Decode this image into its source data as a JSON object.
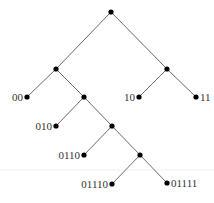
{
  "diagram": {
    "type": "binary-tree",
    "title": "",
    "colors": {
      "edge": "#6a6a6a",
      "node": "#000000",
      "label": "#333333"
    },
    "nodes": [
      {
        "id": "root",
        "x": 111,
        "y": 12,
        "label": ""
      },
      {
        "id": "0",
        "x": 56,
        "y": 69,
        "label": ""
      },
      {
        "id": "1",
        "x": 167,
        "y": 69,
        "label": ""
      },
      {
        "id": "00",
        "x": 27,
        "y": 97,
        "label": "00",
        "label_side": "left"
      },
      {
        "id": "01",
        "x": 84,
        "y": 97,
        "label": ""
      },
      {
        "id": "10",
        "x": 139,
        "y": 97,
        "label": "10",
        "label_side": "left"
      },
      {
        "id": "11",
        "x": 196,
        "y": 97,
        "label": "11",
        "label_side": "right"
      },
      {
        "id": "010",
        "x": 56,
        "y": 126,
        "label": "010",
        "label_side": "left"
      },
      {
        "id": "011",
        "x": 112,
        "y": 126,
        "label": ""
      },
      {
        "id": "0110",
        "x": 84,
        "y": 155,
        "label": "0110",
        "label_side": "left"
      },
      {
        "id": "0111",
        "x": 140,
        "y": 155,
        "label": ""
      },
      {
        "id": "01110",
        "x": 112,
        "y": 184,
        "label": "01110",
        "label_side": "left"
      },
      {
        "id": "01111",
        "x": 167,
        "y": 183,
        "label": "01111",
        "label_side": "right"
      }
    ],
    "edges": [
      [
        "root",
        "0"
      ],
      [
        "root",
        "1"
      ],
      [
        "0",
        "00"
      ],
      [
        "0",
        "01"
      ],
      [
        "1",
        "10"
      ],
      [
        "1",
        "11"
      ],
      [
        "01",
        "010"
      ],
      [
        "01",
        "011"
      ],
      [
        "011",
        "0110"
      ],
      [
        "011",
        "0111"
      ],
      [
        "0111",
        "01110"
      ],
      [
        "0111",
        "01111"
      ]
    ],
    "leaf_labels": [
      "00",
      "010",
      "0110",
      "01110",
      "01111",
      "10",
      "11"
    ]
  }
}
